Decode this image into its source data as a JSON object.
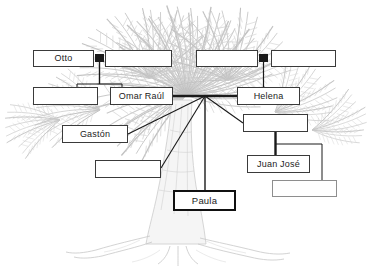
{
  "diagram": {
    "background_icon": "palm-tree-illustration",
    "canvas": {
      "width": 372,
      "height": 277
    },
    "colors": {
      "page_background": "#ffffff",
      "box_fill": "#ffffff",
      "box_border": "#3a3a3a",
      "faint_box_border": "#8e8e8e",
      "highlight_box_border": "#111111",
      "label_text": "#1b1b1b",
      "connector_line": "#1a1a1a",
      "tree_art": "#b9b9b9"
    },
    "nodes": [
      {
        "id": "n1",
        "label": "Otto",
        "named": true,
        "highlight": false,
        "faint": false,
        "x": 33,
        "y": 50,
        "w": 61,
        "h": 17
      },
      {
        "id": "n2",
        "label": "",
        "named": false,
        "highlight": false,
        "faint": false,
        "x": 105,
        "y": 50,
        "w": 67,
        "h": 17
      },
      {
        "id": "n3",
        "label": "",
        "named": false,
        "highlight": false,
        "faint": false,
        "x": 196,
        "y": 50,
        "w": 62,
        "h": 17
      },
      {
        "id": "n4",
        "label": "",
        "named": false,
        "highlight": false,
        "faint": false,
        "x": 271,
        "y": 50,
        "w": 65,
        "h": 17
      },
      {
        "id": "n5",
        "label": "",
        "named": false,
        "highlight": false,
        "faint": false,
        "x": 33,
        "y": 87,
        "w": 65,
        "h": 18
      },
      {
        "id": "n6",
        "label": "Omar Raúl",
        "named": true,
        "highlight": false,
        "faint": false,
        "x": 110,
        "y": 87,
        "w": 63,
        "h": 18
      },
      {
        "id": "n7",
        "label": "Helena",
        "named": true,
        "highlight": false,
        "faint": false,
        "x": 237,
        "y": 87,
        "w": 63,
        "h": 18
      },
      {
        "id": "n8",
        "label": "",
        "named": false,
        "highlight": false,
        "faint": false,
        "x": 243,
        "y": 114,
        "w": 65,
        "h": 18
      },
      {
        "id": "n9",
        "label": "Gastón",
        "named": true,
        "highlight": false,
        "faint": false,
        "x": 62,
        "y": 125,
        "w": 66,
        "h": 18
      },
      {
        "id": "n10",
        "label": "",
        "named": false,
        "highlight": false,
        "faint": false,
        "x": 95,
        "y": 160,
        "w": 66,
        "h": 18
      },
      {
        "id": "n11",
        "label": "Juan José",
        "named": true,
        "highlight": false,
        "faint": false,
        "x": 247,
        "y": 155,
        "w": 63,
        "h": 18
      },
      {
        "id": "n12",
        "label": "",
        "named": false,
        "highlight": false,
        "faint": true,
        "x": 272,
        "y": 180,
        "w": 65,
        "h": 17
      },
      {
        "id": "n13",
        "label": "Paula",
        "named": true,
        "highlight": true,
        "faint": false,
        "x": 173,
        "y": 190,
        "w": 63,
        "h": 21
      }
    ],
    "marriage_bars": [
      {
        "id": "m1",
        "between": [
          "Otto",
          "spouse-of-otto"
        ],
        "x": 95,
        "y": 54,
        "w": 9,
        "h": 8
      },
      {
        "id": "m2",
        "between": [
          "helena-father",
          "helena-mother"
        ],
        "x": 259,
        "y": 54,
        "w": 9,
        "h": 8
      }
    ],
    "connectors": [
      {
        "id": "c1",
        "from": "Otto couple",
        "to": "children sibling bar",
        "kind": "vertical-drop"
      },
      {
        "id": "c2",
        "from": "sibling bar",
        "to": "unnamed child box",
        "kind": "vertical-drop"
      },
      {
        "id": "c3",
        "from": "sibling bar",
        "to": "Omar Raúl",
        "kind": "vertical-drop"
      },
      {
        "id": "c4",
        "from": "Helena parents",
        "to": "Helena",
        "kind": "vertical-drop"
      },
      {
        "id": "c5",
        "from": "Omar Raúl",
        "to": "Helena",
        "kind": "marriage-thick"
      },
      {
        "id": "c6",
        "from": "Omar Raúl & Helena",
        "to": "Gastón",
        "kind": "diagonal"
      },
      {
        "id": "c7",
        "from": "Omar Raúl & Helena",
        "to": "unnamed sibling",
        "kind": "diagonal"
      },
      {
        "id": "c8",
        "from": "Omar Raúl & Helena",
        "to": "Paula",
        "kind": "vertical-drop"
      },
      {
        "id": "c9",
        "from": "Omar Raúl & Helena",
        "to": "Helena-side child",
        "kind": "diagonal"
      },
      {
        "id": "c10",
        "from": "Helena-side child",
        "to": "Juan José",
        "kind": "vertical-thick"
      },
      {
        "id": "c11",
        "from": "Juan José line",
        "to": "bottom-right box",
        "kind": "elbow"
      }
    ]
  }
}
